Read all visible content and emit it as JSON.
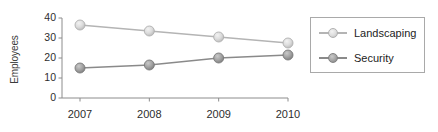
{
  "chart_data": {
    "type": "line",
    "title": "",
    "xlabel": "",
    "ylabel": "Employees",
    "categories": [
      "2007",
      "2008",
      "2009",
      "2010"
    ],
    "ylim": [
      0,
      40
    ],
    "yticks": [
      "0",
      "10",
      "20",
      "30",
      "40"
    ],
    "grid": false,
    "legend_position": "right",
    "series": [
      {
        "name": "Landscaping",
        "values": [
          36.5,
          33.5,
          30.5,
          27.5
        ],
        "color": "#cfcfcf",
        "line_color": "#b4b4b4"
      },
      {
        "name": "Security",
        "values": [
          15,
          16.5,
          20,
          21.5
        ],
        "color": "#9a9a9a",
        "line_color": "#8a8a8a"
      }
    ]
  },
  "axes": {
    "y_title": "Employees",
    "y_tick_labels": [
      "40",
      "30",
      "20",
      "10",
      "0"
    ],
    "x_tick_labels": [
      "2007",
      "2008",
      "2009",
      "2010"
    ],
    "axis_color": "#8c8c8c"
  },
  "legend": {
    "items": [
      {
        "label": "Landscaping",
        "marker": "circle-marker-light"
      },
      {
        "label": "Security",
        "marker": "circle-marker-dark"
      }
    ]
  }
}
